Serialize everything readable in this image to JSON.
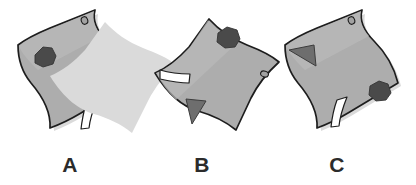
{
  "figure": {
    "type": "mental-rotation-stimulus",
    "background_color": "#ffffff",
    "item_count": 3,
    "palette": {
      "sheet_fill": "#adadad",
      "sheet_fill_light": "#b8b8b8",
      "sheet_outline": "#1d1d1d",
      "shadow": "#d9d9d9",
      "marker_dark": "#4a4a4a",
      "marker_triangle": "#6e6e6e",
      "marker_white": "#ffffff",
      "label_color": "#2b2b2b"
    },
    "items": [
      {
        "id": "item-a",
        "label": "A",
        "label_x": 70,
        "label_y": 172,
        "orientation": "upright",
        "markers": [
          {
            "name": "dark-heptagon",
            "position": "upper-left",
            "color": "#4a4a4a"
          },
          {
            "name": "gray-triangle",
            "position": "mid-right",
            "color": "#6e6e6e",
            "points": "right"
          },
          {
            "name": "white-sliver",
            "position": "lower-center",
            "color": "#ffffff"
          },
          {
            "name": "corner-hole",
            "position": "top-corner",
            "color": "#8e8e8e"
          }
        ]
      },
      {
        "id": "item-b",
        "label": "B",
        "label_x": 202,
        "label_y": 172,
        "orientation": "rotated",
        "markers": [
          {
            "name": "dark-heptagon",
            "position": "upper-right",
            "color": "#4a4a4a"
          },
          {
            "name": "gray-triangle",
            "position": "lower-left",
            "color": "#6e6e6e",
            "points": "down"
          },
          {
            "name": "white-sliver",
            "position": "mid-left",
            "color": "#ffffff"
          },
          {
            "name": "corner-hole",
            "position": "right-edge",
            "color": "#8e8e8e"
          }
        ]
      },
      {
        "id": "item-c",
        "label": "C",
        "label_x": 337,
        "label_y": 172,
        "orientation": "mirrored",
        "markers": [
          {
            "name": "gray-triangle",
            "position": "upper-left",
            "color": "#6e6e6e",
            "points": "left"
          },
          {
            "name": "dark-heptagon",
            "position": "lower-right",
            "color": "#4a4a4a"
          },
          {
            "name": "white-sliver",
            "position": "bottom-center",
            "color": "#ffffff"
          },
          {
            "name": "corner-hole",
            "position": "top-corner",
            "color": "#8e8e8e"
          }
        ]
      }
    ]
  }
}
